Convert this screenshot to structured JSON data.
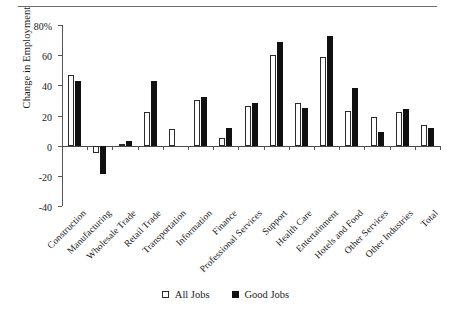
{
  "figure": {
    "ylabel": "Change in Employment"
  },
  "legend": {
    "items": [
      {
        "label": "All Jobs",
        "swatch": "hollow-square",
        "color": "#ffffff"
      },
      {
        "label": "Good Jobs",
        "swatch": "filled-square",
        "color": "#111111"
      }
    ]
  },
  "chart_data": {
    "type": "bar",
    "title": "",
    "xlabel": "",
    "ylabel": "Change in Employment",
    "ylim": [
      -40,
      80
    ],
    "yticks": [
      -40,
      -20,
      0,
      20,
      40,
      60,
      80
    ],
    "ytick_labels": [
      "-40",
      "-20",
      "0",
      "20",
      "40",
      "60",
      "80%"
    ],
    "grid": false,
    "legend_position": "bottom-center",
    "categories": [
      "Construction",
      "Manufacturing",
      "Wholesale Trade",
      "Retail Trade",
      "Transportation",
      "Information",
      "Finance",
      "Professional Services",
      "Support",
      "Health Care",
      "Entertainment",
      "Hotels and Food",
      "Other Services",
      "Other Industries",
      "Total"
    ],
    "series": [
      {
        "name": "All Jobs",
        "values": [
          47,
          -5,
          1,
          22,
          11,
          30,
          5,
          26,
          60,
          28,
          59,
          23,
          19,
          22,
          14
        ]
      },
      {
        "name": "Good Jobs",
        "values": [
          43,
          -19,
          3,
          43,
          0,
          32,
          12,
          28,
          69,
          25,
          73,
          38,
          9,
          24,
          12
        ]
      }
    ]
  }
}
